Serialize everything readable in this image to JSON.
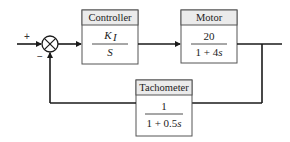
{
  "diagram": {
    "type": "feedback-control-block-diagram",
    "summing_junction": {
      "input_sign": "+",
      "feedback_sign": "−"
    },
    "blocks": [
      {
        "id": "controller",
        "title": "Controller",
        "numerator": "K",
        "numerator_subscript": "I",
        "denominator": "S"
      },
      {
        "id": "motor",
        "title": "Motor",
        "numerator": "20",
        "denominator_const": "1 + 4",
        "denominator_var": "s"
      },
      {
        "id": "tachometer",
        "title": "Tachometer",
        "numerator": "1",
        "denominator_const": "1 + 0.5",
        "denominator_var": "s"
      }
    ],
    "colors": {
      "line": "#1a1a1a",
      "block_border": "#555555",
      "block_header_bg": "#ebebeb",
      "block_body_bg": "#ffffff"
    }
  }
}
